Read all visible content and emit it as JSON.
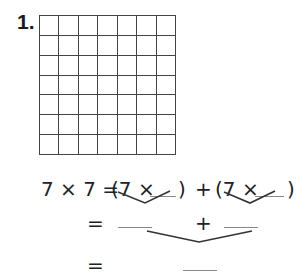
{
  "problem": {
    "number": "1.",
    "grid": {
      "rows": 7,
      "cols": 7
    },
    "equation": {
      "lhs": "7 × 7 =",
      "term1_open": "(7 ×",
      "term1_close": ")",
      "plus": "+",
      "term2_open": "(7 ×",
      "term2_close": ")"
    },
    "line2": {
      "equals": "=",
      "plus": "+"
    },
    "line3": {
      "equals": "="
    },
    "blanks": {
      "term1_factor": "",
      "term2_factor": "",
      "product1": "",
      "product2": "",
      "total": ""
    }
  }
}
